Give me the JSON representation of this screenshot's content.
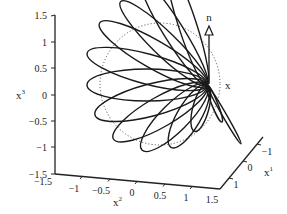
{
  "figure": {
    "type": "3d-line-plot"
  },
  "axes": {
    "z": {
      "label": "x",
      "sup": "3",
      "ticks": [
        "1.5",
        "1",
        "0.5",
        "0",
        "−0.5",
        "−1",
        "−1.5"
      ]
    },
    "y": {
      "label": "x",
      "sup": "2",
      "ticks": [
        "−1.5",
        "−1",
        "−0.5",
        "0",
        "0.5",
        "1",
        "1.5"
      ]
    },
    "x": {
      "label": "x",
      "sup": "1",
      "ticks": [
        "1",
        "0",
        "−1"
      ]
    }
  },
  "annotations": {
    "normal_label": "n",
    "point_label": "x"
  },
  "colors": {
    "line": "#1a1a1a",
    "axis": "#222222",
    "dotted": "#444444"
  },
  "loops": [
    {
      "angle": -72,
      "rx": 63,
      "ry": 9
    },
    {
      "angle": -58,
      "rx": 62,
      "ry": 10
    },
    {
      "angle": -44,
      "rx": 60,
      "ry": 12
    },
    {
      "angle": -30,
      "rx": 62,
      "ry": 14
    },
    {
      "angle": -15,
      "rx": 62,
      "ry": 15
    },
    {
      "angle": 0,
      "rx": 60,
      "ry": 16
    },
    {
      "angle": 15,
      "rx": 58,
      "ry": 16
    },
    {
      "angle": 30,
      "rx": 54,
      "ry": 15
    },
    {
      "angle": 45,
      "rx": 46,
      "ry": 14
    },
    {
      "angle": 60,
      "rx": 36,
      "ry": 12
    },
    {
      "angle": 75,
      "rx": 24,
      "ry": 8
    },
    {
      "angle": 112,
      "rx": 20,
      "ry": 3
    },
    {
      "angle": 120,
      "rx": 34,
      "ry": 2
    }
  ]
}
